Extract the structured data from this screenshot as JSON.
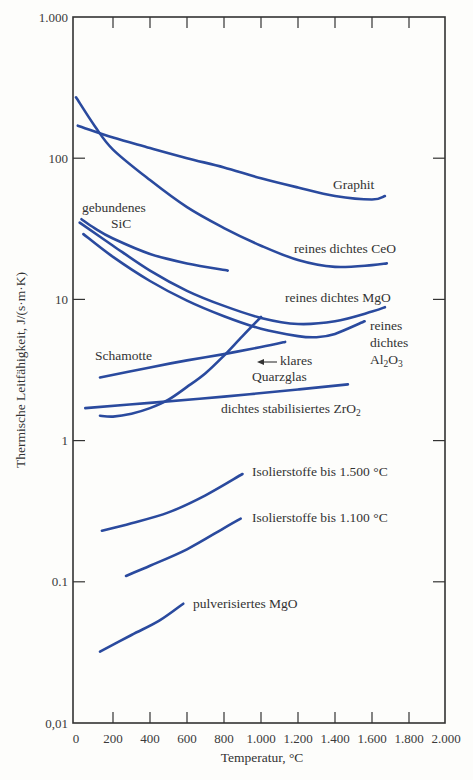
{
  "chart_data": {
    "type": "line",
    "title": "",
    "xlabel": "Temperatur, °C",
    "ylabel": "Thermische Leitfähigkeit, J/(s·m·K)",
    "xlim": [
      0,
      2000
    ],
    "ylim": [
      0.01,
      1000
    ],
    "yscale": "log",
    "grid": false,
    "legend": "inline labels",
    "x_ticks": [
      0,
      200,
      400,
      600,
      800,
      1000,
      1200,
      1400,
      1600,
      1800,
      2000
    ],
    "x_tick_labels": [
      "0",
      "200",
      "400",
      "600",
      "800",
      "1.000",
      "1.200",
      "1.400",
      "1.600",
      "1.800",
      "2.000"
    ],
    "y_ticks": [
      0.01,
      0.1,
      1,
      10,
      100,
      1000
    ],
    "y_tick_labels": [
      "0,01",
      "0.1",
      "1",
      "10",
      "100",
      "1.000"
    ],
    "series": [
      {
        "name": "Graphit",
        "x": [
          10,
          200,
          400,
          600,
          800,
          1000,
          1200,
          1400,
          1600,
          1670
        ],
        "y": [
          170,
          140,
          118,
          100,
          86,
          72,
          62,
          54,
          51,
          54
        ]
      },
      {
        "name": "reines dichtes CeO",
        "x": [
          0,
          100,
          200,
          400,
          600,
          800,
          1000,
          1200,
          1400,
          1600,
          1680
        ],
        "y": [
          270,
          170,
          115,
          70,
          45,
          32,
          24,
          19,
          17,
          17.5,
          18
        ]
      },
      {
        "name": "gebundenes SiC",
        "x": [
          30,
          100,
          200,
          400,
          600,
          820
        ],
        "y": [
          37,
          32,
          27,
          21,
          18,
          16
        ]
      },
      {
        "name": "reines dichtes MgO",
        "x": [
          20,
          200,
          400,
          600,
          800,
          1000,
          1200,
          1400,
          1600,
          1670
        ],
        "y": [
          35,
          24,
          16,
          11.5,
          9,
          7.4,
          6.7,
          7,
          8.2,
          8.8
        ]
      },
      {
        "name": "reines dichtes Al2O3",
        "x": [
          40,
          200,
          400,
          600,
          800,
          1000,
          1200,
          1300,
          1400,
          1560
        ],
        "y": [
          29,
          20,
          13.5,
          9.8,
          7.6,
          6.2,
          5.5,
          5.4,
          5.7,
          7
        ]
      },
      {
        "name": "Schamotte",
        "x": [
          130,
          400,
          600,
          800,
          1000,
          1130
        ],
        "y": [
          2.8,
          3.3,
          3.7,
          4.1,
          4.6,
          5.0
        ]
      },
      {
        "name": "klares Quarzglas",
        "x": [
          130,
          200,
          300,
          400,
          500,
          600,
          700,
          800,
          900,
          1000
        ],
        "y": [
          1.5,
          1.48,
          1.55,
          1.7,
          1.95,
          2.4,
          3.0,
          4.0,
          5.5,
          7.5
        ]
      },
      {
        "name": "dichtes stabilisiertes ZrO2",
        "x": [
          50,
          400,
          800,
          1200,
          1470
        ],
        "y": [
          1.7,
          1.85,
          2.05,
          2.3,
          2.5
        ]
      },
      {
        "name": "Isolierstoffe bis 1.500 °C",
        "x": [
          140,
          300,
          500,
          700,
          900
        ],
        "y": [
          0.23,
          0.26,
          0.31,
          0.41,
          0.58
        ]
      },
      {
        "name": "Isolierstoffe bis 1.100 °C",
        "x": [
          270,
          400,
          600,
          800,
          890
        ],
        "y": [
          0.11,
          0.13,
          0.17,
          0.24,
          0.28
        ]
      },
      {
        "name": "pulverisiertes MgO",
        "x": [
          130,
          300,
          450,
          580
        ],
        "y": [
          0.032,
          0.042,
          0.053,
          0.07
        ]
      }
    ],
    "annotations": [
      {
        "text": "←",
        "target": "klares Quarzglas",
        "at": [
          810,
          3.8
        ]
      }
    ]
  },
  "labels": {
    "graphit": "Graphit",
    "ceo": "reines dichtes CeO",
    "sic_1": "gebundenes",
    "sic_2": "SiC",
    "mgo": "reines dichtes MgO",
    "al2o3_1": "reines",
    "al2o3_2": "dichtes",
    "al2o3_3a": "Al",
    "al2o3_3b": "2",
    "al2o3_3c": "O",
    "al2o3_3d": "3",
    "schamotte": "Schamotte",
    "quarz_1": "klares",
    "quarz_2": "Quarzglas",
    "zro2_a": "dichtes stabilisiertes ZrO",
    "zro2_b": "2",
    "iso1500": "Isolierstoffe bis 1.500 °C",
    "iso1100": "Isolierstoffe bis 1.100 °C",
    "pulv_mgo": "pulverisiertes MgO"
  },
  "colors": {
    "curve": "#2a4a9e",
    "axis": "#333333"
  }
}
